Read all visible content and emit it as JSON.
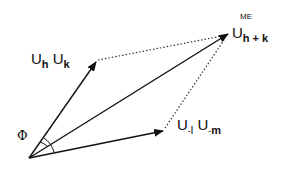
{
  "diagram": {
    "type": "vector-diagram",
    "origin": {
      "x": 29,
      "y": 158
    },
    "vectors": [
      {
        "id": "u_hk",
        "label_main": "U",
        "sub1": "h",
        "label_main2": "U",
        "sub2": "k",
        "tip": {
          "x": 96,
          "y": 62
        }
      },
      {
        "id": "u_sum",
        "label_main": "U",
        "sub": "h + k",
        "superscript": "ME",
        "tip": {
          "x": 228,
          "y": 34
        }
      },
      {
        "id": "u_lm",
        "label_main": "U",
        "pre1": "-",
        "sub1": "l",
        "label_main2": "U",
        "pre2": "-",
        "sub2": "m",
        "tip": {
          "x": 163,
          "y": 131
        }
      }
    ],
    "angle_label": "Φ",
    "line_color": "#111111",
    "dotted_color": "#333333"
  }
}
